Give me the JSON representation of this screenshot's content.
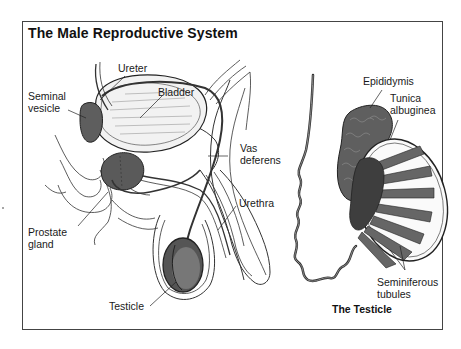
{
  "title": "The Male Reproductive System",
  "panels": {
    "main": {
      "name": "Sagittal section",
      "labels": {
        "ureter": "Ureter",
        "seminal_vesicle": "Seminal\nvesicle",
        "bladder": "Bladder",
        "vas_deferens": "Vas\ndeferens",
        "urethra": "Urethra",
        "prostate_gland": "Prostate\ngland",
        "testicle": "Testicle"
      }
    },
    "detail": {
      "caption": "The Testicle",
      "labels": {
        "epididymis": "Epididymis",
        "tunica_albuginea": "Tunica\nalbuginea",
        "seminiferous_tubules": "Seminiferous\ntubules"
      }
    }
  },
  "colors": {
    "frame": "#444444",
    "line": "#222222",
    "organ_dark": "#5a5a5a",
    "organ_mid": "#7a7a7a",
    "tissue_light": "#e8e8e8",
    "background": "#ffffff"
  }
}
